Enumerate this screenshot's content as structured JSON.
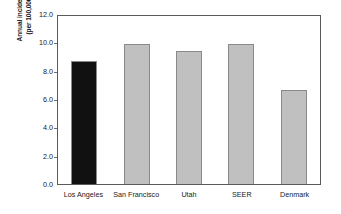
{
  "chart_data": {
    "type": "bar",
    "title": "",
    "subtitle": "",
    "xlabel": "",
    "ylabel": "Annual incidence (per 100,000)",
    "ylabel_lines": [
      "Annual incidence",
      "(per 100,000)"
    ],
    "categories": [
      "Los Angeles",
      "San Francisco",
      "Utah",
      "SEER",
      "Denmark"
    ],
    "values": [
      8.8,
      10.0,
      9.5,
      10.0,
      6.7
    ],
    "bar_colors": [
      "#111111",
      "#C0C0C0",
      "#C0C0C0",
      "#C0C0C0",
      "#C0C0C0"
    ],
    "bar_border_color": "#8A8A8A",
    "ylim": [
      0.0,
      12.0
    ],
    "ytick_values": [
      0.0,
      2.0,
      4.0,
      6.0,
      8.0,
      10.0,
      12.0
    ],
    "ytick_labels": [
      "0.0",
      "2.0",
      "4.0",
      "6.0",
      "8.0",
      "10.0",
      "12.0"
    ],
    "grid": false,
    "legend": null,
    "legend_position": "none",
    "plot_border_color": "#5A5A5A",
    "background_color": "#FFFFFF"
  }
}
